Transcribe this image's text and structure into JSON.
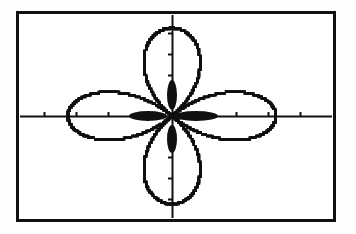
{
  "screen": {
    "kind": "graphing-calculator-screen",
    "width": 356,
    "height": 234,
    "background_color": "#ffffff",
    "ink_color": "#101010",
    "outside_color": "#fdfdfd"
  },
  "frame": {
    "label": "viewport-border",
    "x": 16,
    "y": 11,
    "width": 320,
    "height": 211,
    "stroke_width": 3,
    "color": "#101010"
  },
  "chart_data": {
    "type": "line",
    "subtype": "polar-rose",
    "title": "",
    "subtitle": "",
    "xlabel": "",
    "ylabel": "",
    "equation": "r = a*cos(2*theta)",
    "petal_count": 4,
    "theta_range_deg": [
      0,
      360
    ],
    "amplitude_px": {
      "x": 104,
      "y": 88
    },
    "origin_px": {
      "x": 172,
      "y": 116
    },
    "xlim": [
      -4,
      4
    ],
    "ylim": [
      -2.6,
      2.6
    ],
    "grid": false,
    "legend": null,
    "legend_position": "none",
    "tick_labels_visible": false,
    "series": [
      {
        "name": "rose-curve",
        "color": "#101010",
        "style": "pixelated-dotted",
        "line_width": 2.4,
        "petals": [
          {
            "name": "upper-left-petal",
            "direction_deg": 135,
            "tip_px": {
              "x": 96,
              "y": 34
            }
          },
          {
            "name": "upper-right-petal",
            "direction_deg": 45,
            "tip_px": {
              "x": 248,
              "y": 34
            }
          },
          {
            "name": "lower-left-petal",
            "direction_deg": 225,
            "tip_px": {
              "x": 96,
              "y": 198
            }
          },
          {
            "name": "lower-right-petal",
            "direction_deg": 315,
            "tip_px": {
              "x": 248,
              "y": 198
            }
          }
        ]
      }
    ],
    "axes": {
      "x_axis": {
        "name": "x-axis",
        "y_px": 116,
        "x_start_px": 20,
        "x_end_px": 332,
        "line_width": 2,
        "tick_length_px": 4,
        "tick_positions_px": [
          44,
          76,
          108,
          140,
          204,
          236,
          268,
          300
        ]
      },
      "y_axis": {
        "name": "y-axis",
        "x_px": 172,
        "y_start_px": 15,
        "y_end_px": 218,
        "line_width": 2,
        "tick_length_px": 4,
        "tick_positions_px": [
          33,
          54,
          75,
          96,
          136,
          157,
          178,
          199
        ]
      }
    },
    "origin_blobs": [
      {
        "name": "blob-right",
        "cx": 196,
        "cy": 116,
        "rx": 22,
        "ry": 5
      },
      {
        "name": "blob-left",
        "cx": 148,
        "cy": 116,
        "rx": 19,
        "ry": 5
      },
      {
        "name": "blob-up",
        "cx": 172,
        "cy": 95,
        "rx": 5,
        "ry": 15
      },
      {
        "name": "blob-down",
        "cx": 172,
        "cy": 139,
        "rx": 5,
        "ry": 14
      }
    ]
  }
}
